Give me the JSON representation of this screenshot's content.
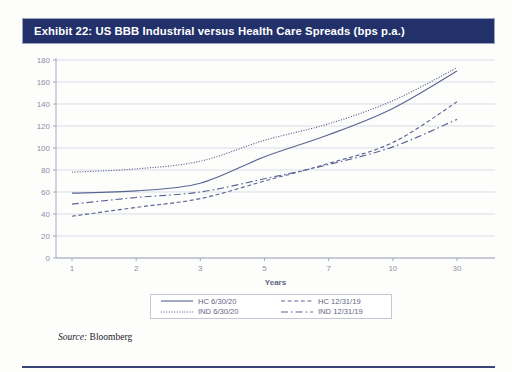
{
  "exhibit": {
    "title": "Exhibit 22: US BBB Industrial versus Health Care Spreads (bps p.a.)",
    "title_bar_color": "#23316b",
    "source_label": "Source:",
    "source_value": "Bloomberg"
  },
  "legend": {
    "items": [
      {
        "label": "HC 6/30/20",
        "style": "solid",
        "icon": "line-solid-icon"
      },
      {
        "label": "HC 12/31/19",
        "style": "dashed",
        "icon": "line-dashed-icon"
      },
      {
        "label": "IND 6/30/20",
        "style": "dotted",
        "icon": "line-dotted-icon"
      },
      {
        "label": "IND 12/31/19",
        "style": "dashdot",
        "icon": "line-dashdot-icon"
      }
    ]
  },
  "chart_data": {
    "type": "line",
    "title": "Exhibit 22: US BBB Industrial versus Health Care Spreads (bps p.a.)",
    "xlabel": "Years",
    "ylabel": "",
    "categories": [
      "1",
      "2",
      "3",
      "5",
      "7",
      "10",
      "30"
    ],
    "x_tick_labels": [
      "1",
      "2",
      "3",
      "5",
      "7",
      "10",
      "30"
    ],
    "y_tick_labels": [
      "0",
      "20",
      "40",
      "60",
      "80",
      "100",
      "120",
      "140",
      "160",
      "180"
    ],
    "ylim": [
      0,
      180
    ],
    "y_tick_step": 20,
    "grid": "horizontal",
    "legend_position": "bottom",
    "line_color": "#5b6593",
    "series": [
      {
        "name": "HC 6/30/20",
        "style": "solid",
        "values": [
          59,
          61,
          68,
          92,
          112,
          136,
          170
        ]
      },
      {
        "name": "IND 6/30/20",
        "style": "dotted",
        "values": [
          78,
          81,
          88,
          107,
          122,
          143,
          173
        ]
      },
      {
        "name": "HC 12/31/19",
        "style": "dashed",
        "values": [
          38,
          46,
          54,
          70,
          86,
          105,
          142
        ]
      },
      {
        "name": "IND 12/31/19",
        "style": "dashdot",
        "values": [
          49,
          55,
          60,
          72,
          85,
          101,
          126
        ]
      }
    ]
  }
}
